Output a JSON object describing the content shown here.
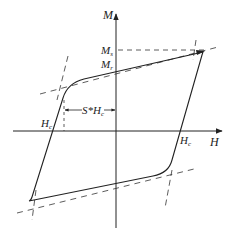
{
  "diagram": {
    "type": "magnetic hysteresis loop",
    "axes": {
      "x_label": "H",
      "y_label": "M"
    },
    "labels": {
      "saturation": "M",
      "saturation_sub": "s",
      "remanence": "M",
      "remanence_sub": "r",
      "coercive_left": "H",
      "coercive_left_sub": "c",
      "coercive_right": "H",
      "coercive_right_sub": "c",
      "squareness_prefix": "S*H",
      "squareness_sub": "c"
    },
    "colors": {
      "line": "#222222",
      "background": "#ffffff"
    }
  }
}
